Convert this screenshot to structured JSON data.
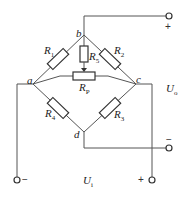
{
  "diagram": {
    "type": "wheatstone-bridge-circuit",
    "nodes": {
      "a": "a",
      "b": "b",
      "c": "c",
      "d": "d"
    },
    "resistors": [
      {
        "id": "R1",
        "label": "R",
        "sub": "1",
        "between": "a-b"
      },
      {
        "id": "R2",
        "label": "R",
        "sub": "2",
        "between": "b-c"
      },
      {
        "id": "R3",
        "label": "R",
        "sub": "3",
        "between": "c-d"
      },
      {
        "id": "R4",
        "label": "R",
        "sub": "4",
        "between": "a-d"
      },
      {
        "id": "R5",
        "label": "R",
        "sub": "5",
        "between": "b-Rp wiper"
      },
      {
        "id": "RP",
        "label": "R",
        "sub": "P",
        "between": "a-c (potentiometer)"
      }
    ],
    "output": {
      "label": "U",
      "sub": "o",
      "plus": "+",
      "minus": "−"
    },
    "input": {
      "label": "U",
      "sub": "i",
      "plus": "+",
      "minus": "−"
    }
  }
}
